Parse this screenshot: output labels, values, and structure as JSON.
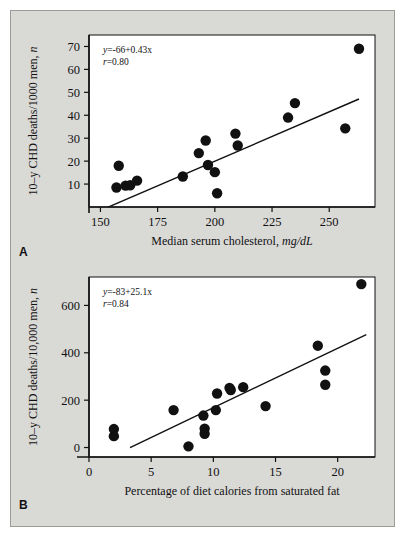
{
  "figure": {
    "background_color": "#d9d9d6",
    "panels": [
      {
        "letter": "A",
        "equation": "y=-66+0.43x",
        "correlation": "r=0.80"
      },
      {
        "letter": "B",
        "equation": "y=-83+25.1x",
        "correlation": "r=0.84"
      }
    ]
  },
  "chart_data": [
    {
      "type": "scatter",
      "panel": "A",
      "title": "",
      "xlabel": "Median serum cholesterol, mg/dL",
      "xlabel_main": "Median serum cholesterol,",
      "xlabel_units": "mg/dL",
      "ylabel": "10-y CHD deaths/1000 men, n",
      "ylabel_main": "10–y CHD deaths/1000 men,",
      "ylabel_units": "n",
      "xlim": [
        145,
        270
      ],
      "ylim": [
        0,
        75
      ],
      "xticks": [
        150,
        175,
        200,
        225,
        250
      ],
      "yticks": [
        10,
        20,
        30,
        40,
        50,
        60,
        70
      ],
      "grid": false,
      "annotation_equation": "y=-66+0.43x",
      "annotation_r": "r=0.80",
      "fit": {
        "intercept": -66,
        "slope": 0.43,
        "x_start": 152,
        "x_end": 263
      },
      "points": [
        {
          "x": 157,
          "y": 8.5
        },
        {
          "x": 158,
          "y": 18.0
        },
        {
          "x": 161,
          "y": 9.3
        },
        {
          "x": 163,
          "y": 9.5
        },
        {
          "x": 166,
          "y": 11.5
        },
        {
          "x": 186,
          "y": 13.3
        },
        {
          "x": 193,
          "y": 23.5
        },
        {
          "x": 196,
          "y": 29.0
        },
        {
          "x": 197,
          "y": 18.3
        },
        {
          "x": 200,
          "y": 15.2
        },
        {
          "x": 201,
          "y": 6.0
        },
        {
          "x": 209,
          "y": 32.0
        },
        {
          "x": 210,
          "y": 26.8
        },
        {
          "x": 232,
          "y": 39.0
        },
        {
          "x": 235,
          "y": 45.3
        },
        {
          "x": 257,
          "y": 34.3
        },
        {
          "x": 263,
          "y": 69.0
        }
      ]
    },
    {
      "type": "scatter",
      "panel": "B",
      "title": "",
      "xlabel": "Percentage of diet calories from saturated fat",
      "ylabel": "10-y CHD deaths/10,000 men, n",
      "ylabel_main": "10–y CHD deaths/10,000 men,",
      "ylabel_units": "n",
      "xlim": [
        0,
        23
      ],
      "ylim": [
        -40,
        720
      ],
      "xticks": [
        0,
        5,
        10,
        15,
        20
      ],
      "yticks": [
        0,
        200,
        400,
        600
      ],
      "grid": false,
      "annotation_equation": "y=-83+25.1x",
      "annotation_r": "r=0.84",
      "fit": {
        "intercept": -83,
        "slope": 25.1,
        "x_start": 3.3,
        "x_end": 22.3
      },
      "points": [
        {
          "x": 2.0,
          "y": 78
        },
        {
          "x": 2.0,
          "y": 48
        },
        {
          "x": 6.8,
          "y": 158
        },
        {
          "x": 8.0,
          "y": 5
        },
        {
          "x": 9.2,
          "y": 135
        },
        {
          "x": 9.3,
          "y": 80
        },
        {
          "x": 9.3,
          "y": 58
        },
        {
          "x": 10.2,
          "y": 158
        },
        {
          "x": 10.3,
          "y": 228
        },
        {
          "x": 11.3,
          "y": 252
        },
        {
          "x": 11.4,
          "y": 243
        },
        {
          "x": 12.4,
          "y": 255
        },
        {
          "x": 14.2,
          "y": 175
        },
        {
          "x": 18.4,
          "y": 430
        },
        {
          "x": 19.0,
          "y": 325
        },
        {
          "x": 19.0,
          "y": 265
        },
        {
          "x": 21.9,
          "y": 690
        }
      ]
    }
  ]
}
